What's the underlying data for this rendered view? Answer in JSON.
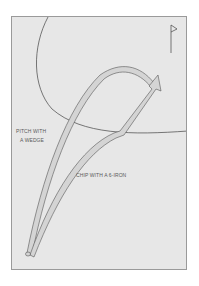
{
  "diagram": {
    "title": "",
    "labels": {
      "pitch_line1": "PITCH WITH",
      "pitch_line2": "A WEDGE",
      "chip": "CHIP WITH A 6-IRON"
    },
    "elements": {
      "green_edge": "curved boundary of putting green",
      "flag": "flag-icon at hole",
      "pitch_path": "high arcing shot path from ball to flag",
      "chip_path": "low running shot path from ball to flag with arrow"
    },
    "colors": {
      "background": "#e7e7e7",
      "frame_border": "#9a9a9a",
      "path_fill": "#d4d4d4",
      "path_stroke": "#555555",
      "text": "#5a5a5a"
    }
  }
}
